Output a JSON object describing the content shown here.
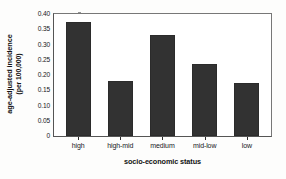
{
  "chart_data": {
    "type": "bar",
    "title": "",
    "xlabel": "socio-economic status",
    "ylabel_line1": "age-adjusted incidence",
    "ylabel_line2": "(per 100,000)",
    "categories": [
      "high",
      "high-mid",
      "medium",
      "mid-low",
      "low"
    ],
    "values": [
      0.375,
      0.18,
      0.332,
      0.235,
      0.174
    ],
    "ylim": [
      0,
      0.4
    ],
    "yticks": [
      0,
      0.05,
      0.1,
      0.15,
      0.2,
      0.25,
      0.3,
      0.35,
      0.4
    ],
    "ytick_labels": [
      "0",
      "0.05",
      "0.10",
      "0.15",
      "0.20",
      "0.25",
      "0.30",
      "0.35",
      "0.40"
    ],
    "grid": false,
    "legend": null,
    "bar_color": "#323232",
    "axis_color": "#555555",
    "background": "#ffffff"
  }
}
